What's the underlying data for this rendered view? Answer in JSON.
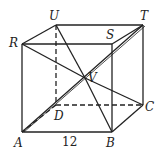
{
  "diagram": {
    "type": "cube",
    "labels": {
      "U": "U",
      "T": "T",
      "R": "R",
      "S": "S",
      "V": "V",
      "D": "D",
      "C": "C",
      "A": "A",
      "B": "B"
    },
    "edge_label": "12",
    "vertices": {
      "U": [
        56,
        25
      ],
      "T": [
        143,
        25
      ],
      "R": [
        22,
        44
      ],
      "S": [
        112,
        44
      ],
      "D": [
        56,
        105
      ],
      "C": [
        143,
        105
      ],
      "A": [
        22,
        132
      ],
      "B": [
        112,
        132
      ],
      "V": [
        85,
        78
      ]
    },
    "solid_edges": [
      [
        "R",
        "U"
      ],
      [
        "U",
        "T"
      ],
      [
        "R",
        "S"
      ],
      [
        "S",
        "T"
      ],
      [
        "R",
        "A"
      ],
      [
        "S",
        "B"
      ],
      [
        "T",
        "C"
      ],
      [
        "A",
        "B"
      ],
      [
        "B",
        "C"
      ]
    ],
    "hidden_edges": [
      [
        "U",
        "D"
      ],
      [
        "D",
        "C"
      ],
      [
        "D",
        "A"
      ]
    ],
    "diagonals": [
      [
        "R",
        "V"
      ],
      [
        "U",
        "V"
      ],
      [
        "V",
        "B"
      ],
      [
        "V",
        "C"
      ],
      [
        "A",
        "T"
      ],
      [
        "S",
        "V"
      ]
    ],
    "stroke_color": "#222222"
  }
}
